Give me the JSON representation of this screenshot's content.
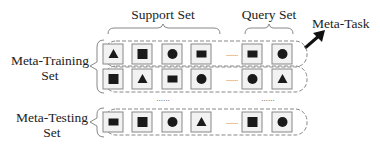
{
  "labels": {
    "support_set": "Support Set",
    "query_set": "Query Set",
    "meta_task": "Meta-Task",
    "meta_training_line1": "Meta-Training",
    "meta_training_line2": "Set",
    "meta_testing_line1": "Meta-Testing",
    "meta_testing_line2": "Set",
    "ellipsis": "......"
  },
  "rows": [
    {
      "group": "meta-training",
      "support": [
        "triangle",
        "square",
        "circle",
        "rectangle"
      ],
      "query": [
        "rectangle",
        "circle"
      ]
    },
    {
      "group": "meta-training",
      "support": [
        "square",
        "triangle",
        "rectangle",
        "circle"
      ],
      "query": [
        "circle",
        "triangle"
      ]
    },
    {
      "group": "meta-testing",
      "support": [
        "rectangle",
        "square",
        "circle",
        "triangle"
      ],
      "query": [
        "square",
        "circle"
      ]
    }
  ],
  "colors": {
    "stroke": "#888888",
    "shape": "#1a1a1a",
    "box_fill": "#f2f2f2",
    "arrow": "#111111"
  }
}
